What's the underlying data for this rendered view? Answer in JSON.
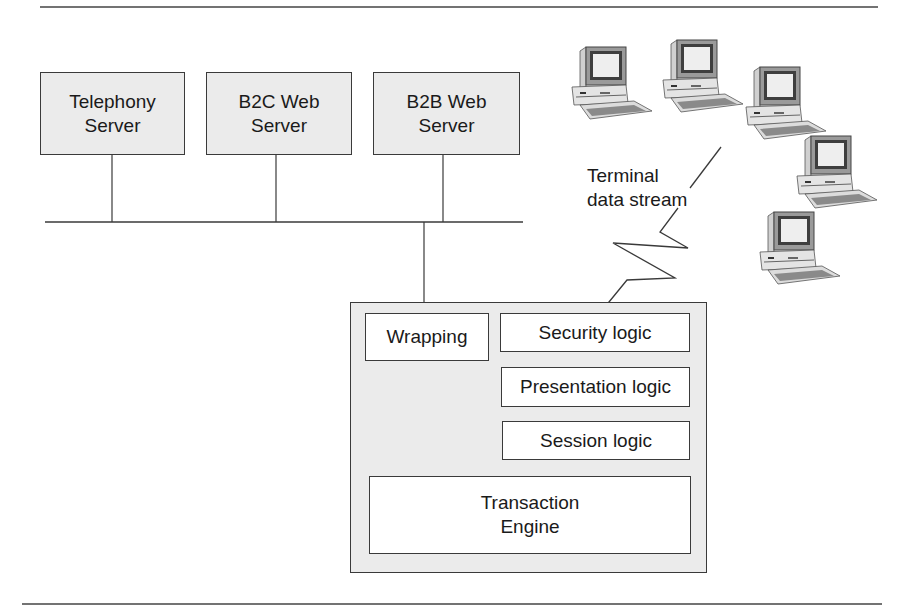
{
  "servers": [
    {
      "line1": "Telephony",
      "line2": "Server"
    },
    {
      "line1": "B2C Web",
      "line2": "Server"
    },
    {
      "line1": "B2B Web",
      "line2": "Server"
    }
  ],
  "host": {
    "wrapping": "Wrapping",
    "security": "Security logic",
    "presentation": "Presentation logic",
    "session": "Session logic",
    "engine_line1": "Transaction",
    "engine_line2": "Engine"
  },
  "stream_label": {
    "line1": "Terminal",
    "line2": "data stream"
  },
  "terminals": [
    {
      "name": "terminal-1"
    },
    {
      "name": "terminal-2"
    },
    {
      "name": "terminal-3"
    },
    {
      "name": "terminal-4"
    },
    {
      "name": "terminal-5"
    }
  ],
  "colors": {
    "line": "#3a3a3a",
    "fill": "#ebebeb",
    "box_fill": "#ffffff"
  }
}
